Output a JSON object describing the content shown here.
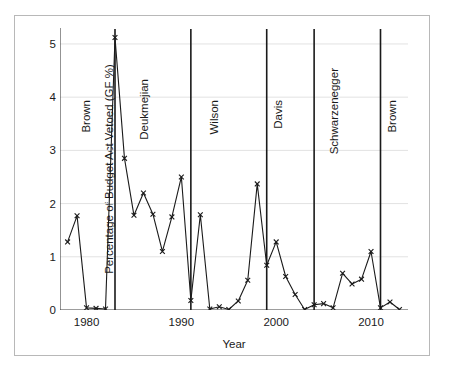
{
  "chart_data": {
    "type": "line",
    "title": "",
    "xlabel": "Year",
    "ylabel": "Percentage of Budget Act Vetoed (GF %)",
    "xlim": [
      1977.2,
      1978.0
    ],
    "ylim": [
      0,
      5.3
    ],
    "grid": true,
    "legend": "none",
    "marker": "x",
    "x_ticks": [
      1980,
      1990,
      2000,
      2010
    ],
    "x_tick_labels": [
      "1980",
      "1990",
      "2000",
      "2010"
    ],
    "y_ticks": [
      0,
      1,
      2,
      3,
      4,
      5
    ],
    "y_tick_labels": [
      "0",
      "1",
      "2",
      "3",
      "4",
      "5"
    ],
    "x": [
      1978,
      1979,
      1980,
      1981,
      1982,
      1983,
      1984,
      1985,
      1986,
      1987,
      1988,
      1989,
      1990,
      1991,
      1992,
      1993,
      1994,
      1995,
      1996,
      1997,
      1998,
      1999,
      2000,
      2001,
      2002,
      2003,
      2004,
      2005,
      2006,
      2007,
      2008,
      2009,
      2010,
      2011,
      2012,
      2013
    ],
    "values": [
      1.28,
      1.77,
      0.04,
      0.03,
      0.02,
      5.12,
      2.85,
      1.78,
      2.2,
      1.8,
      1.1,
      1.75,
      2.5,
      0.18,
      1.79,
      0.02,
      0.06,
      0.01,
      0.17,
      0.56,
      2.37,
      0.84,
      1.28,
      0.63,
      0.29,
      0.01,
      0.1,
      0.12,
      0.04,
      0.69,
      0.49,
      0.58,
      1.1,
      0.04,
      0.15,
      0.01
    ],
    "annotations": [
      {
        "label": "Brown",
        "x_line": null,
        "x_text": 1980.2,
        "y_text": 3.95
      },
      {
        "label": "Deukmejian",
        "x_line": 1983.0,
        "x_text": 1986.3,
        "y_text": 4.35
      },
      {
        "label": "Wilson",
        "x_line": 1991.0,
        "x_text": 1993.6,
        "y_text": 3.95
      },
      {
        "label": "Davis",
        "x_line": 1999.0,
        "x_text": 2000.4,
        "y_text": 3.95
      },
      {
        "label": "Schwarzenegger",
        "x_line": 2004.0,
        "x_text": 2006.3,
        "y_text": 4.55
      },
      {
        "label": "Brown",
        "x_line": 2011.0,
        "x_text": 2012.4,
        "y_text": 3.95
      }
    ],
    "divider_lines": [
      1983.0,
      1991.0,
      1999.0,
      2004.0,
      2011.0
    ],
    "colors": {
      "line": "#1a1a1a",
      "grid": "#e2e2e2",
      "axis": "#4a4a4a",
      "divider": "#1a1a1a",
      "background": "#ffffff"
    }
  },
  "axis": {
    "ylabel": "Percentage of Budget Act Vetoed (GF %)",
    "xlabel": "Year"
  }
}
